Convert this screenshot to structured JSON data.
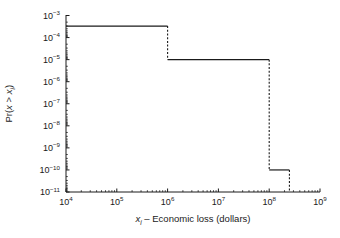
{
  "chart_data": {
    "type": "line",
    "subtype": "step-exceedance-curve",
    "title": "",
    "xlabel": "x_i – Economic loss (dollars)",
    "xlabel_parts": {
      "symbol": "x",
      "subscript": "i",
      "rest": " – Economic loss (dollars)"
    },
    "ylabel": "Pr(x > x_i)",
    "ylabel_parts": {
      "prefix": "Pr(",
      "var1": "x",
      "gt": " > ",
      "var2": "x",
      "subscript": "i",
      "suffix": ")"
    },
    "xscale": "log",
    "yscale": "log",
    "xlim": [
      10000,
      1000000000
    ],
    "ylim": [
      1e-11,
      0.001
    ],
    "grid": false,
    "legend": null,
    "xticks": [
      10000,
      100000,
      1000000,
      10000000,
      100000000,
      1000000000
    ],
    "xtick_labels": [
      "10^4",
      "10^5",
      "10^6",
      "10^7",
      "10^8",
      "10^9"
    ],
    "xtick_mantissas": [
      "10",
      "10",
      "10",
      "10",
      "10",
      "10"
    ],
    "xtick_exponents": [
      "4",
      "5",
      "6",
      "7",
      "8",
      "9"
    ],
    "yticks": [
      0.001,
      0.0001,
      1e-05,
      1e-06,
      1e-07,
      1e-08,
      1e-09,
      1e-10,
      1e-11
    ],
    "ytick_labels": [
      "10^-3",
      "10^-4",
      "10^-5",
      "10^-6",
      "10^-7",
      "10^-8",
      "10^-9",
      "10^-10",
      "10^-11"
    ],
    "ytick_mantissas": [
      "10",
      "10",
      "10",
      "10",
      "10",
      "10",
      "10",
      "10",
      "10"
    ],
    "ytick_exponents": [
      "−3",
      "−4",
      "−5",
      "−6",
      "−7",
      "−8",
      "−9",
      "−10",
      "−11"
    ],
    "series": [
      {
        "name": "exceedance probability",
        "style": "step",
        "points": [
          {
            "x": 10000,
            "y": 0.00033
          },
          {
            "x": 1000000,
            "y": 0.00033
          },
          {
            "x": 1000000,
            "y": 1e-05
          },
          {
            "x": 100000000,
            "y": 1e-05
          },
          {
            "x": 100000000,
            "y": 1e-10
          },
          {
            "x": 250000000,
            "y": 1e-10
          },
          {
            "x": 250000000,
            "y": 1e-11
          }
        ]
      }
    ],
    "segments_solid": [
      {
        "x0": 10000,
        "x1": 1000000,
        "y": 0.00033
      },
      {
        "x0": 1000000,
        "x1": 100000000,
        "y": 1e-05
      },
      {
        "x0": 100000000,
        "x1": 250000000,
        "y": 1e-10
      }
    ],
    "segments_dashed": [
      {
        "x": 1000000,
        "y0": 0.00033,
        "y1": 1e-05
      },
      {
        "x": 100000000,
        "y0": 1e-05,
        "y1": 1e-10
      },
      {
        "x": 250000000,
        "y0": 1e-10,
        "y1": 1e-11
      }
    ],
    "annotations": []
  }
}
